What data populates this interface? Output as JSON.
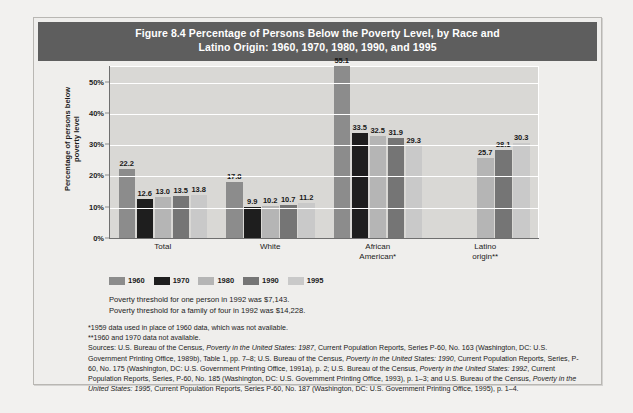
{
  "figure": {
    "title_line1": "Figure 8.4  Percentage of Persons Below the Poverty Level, by Race and",
    "title_line2": "Latino Origin: 1960, 1970, 1980, 1990, and 1995",
    "title_bar_color": "#5e5e5e"
  },
  "notes": {
    "threshold_one": "Poverty threshold for one person in 1992 was $7,143.",
    "threshold_family": "Poverty threshold for a family of four in 1992 was $14,228.",
    "footnote_1": "*1959 data used in place of 1960 data, which was not available.",
    "footnote_2": "**1960 and 1970 data not available.",
    "sources_prefix": "Sources: U.S. Bureau of the Census, ",
    "sources_s1_italic": "Poverty in the United States: 1987",
    "sources_s1_rest": ", Current Population Reports, Series P-60, No. 163 (Washington, DC: U.S. Government Printing Office, 1989b), Table 1, pp. 7–8; U.S. Bureau of the Census, ",
    "sources_s2_italic": "Poverty in the United States: 1990",
    "sources_s2_rest": ", Current Population Reports, Series, P-60, No. 175 (Washington, DC: U.S. Government Printing Office, 1991a), p. 2; U.S. Bureau of the Census, ",
    "sources_s3_italic": "Poverty in the United States: 1992",
    "sources_s3_rest": ", Current Population Reports, Series, P-60, No. 185 (Washington, DC: U.S. Government Printing Office, 1993), p. 1–3; and U.S. Bureau of the Census, ",
    "sources_s4_italic": "Poverty in the United States: 1995",
    "sources_s4_rest": ", Current Population Reports, Series P-60, No. 187 (Washington, DC: U.S. Government Printing Office, 1995), p. 1–4."
  },
  "chart_data": {
    "type": "bar",
    "title": "Figure 8.4  Percentage of Persons Below the Poverty Level, by Race and Latino Origin: 1960, 1970, 1980, 1990, and 1995",
    "xlabel": "",
    "ylabel": "Percentage of persons below poverty level",
    "ylabel_line1": "Percentage of persons below",
    "ylabel_line2": "poverty level",
    "ylim": [
      0,
      55
    ],
    "yticks": [
      "0%",
      "10%",
      "20%",
      "30%",
      "40%",
      "50%"
    ],
    "ytick_values": [
      0,
      10,
      20,
      30,
      40,
      50
    ],
    "grid": true,
    "legend_position": "below-plot",
    "categories": [
      "Total",
      "White",
      "African American*",
      "Latino origin**"
    ],
    "category_labels": [
      [
        "Total"
      ],
      [
        "White"
      ],
      [
        "African",
        "American*"
      ],
      [
        "Latino",
        "origin**"
      ]
    ],
    "series": [
      {
        "name": "1960",
        "color": "#8c8c8c",
        "values": [
          22.2,
          17.8,
          55.1,
          null
        ]
      },
      {
        "name": "1970",
        "color": "#1e1e1e",
        "values": [
          12.6,
          9.9,
          33.5,
          null
        ]
      },
      {
        "name": "1980",
        "color": "#b5b5b5",
        "values": [
          13.0,
          10.2,
          32.5,
          25.7
        ]
      },
      {
        "name": "1990",
        "color": "#757575",
        "values": [
          13.5,
          10.7,
          31.9,
          28.1
        ]
      },
      {
        "name": "1995",
        "color": "#c9c9c9",
        "values": [
          13.8,
          11.2,
          29.3,
          30.3
        ]
      }
    ]
  }
}
